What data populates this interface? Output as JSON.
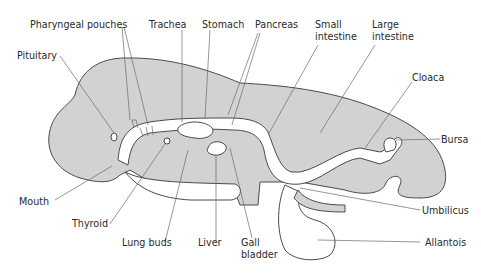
{
  "diagram": {
    "title": "",
    "colors": {
      "tissue": "#d2d2d2",
      "outline": "#4a4a4a",
      "lumen": "#ffffff",
      "text": "#2a2a2a"
    },
    "labels": {
      "pharyngeal_pouches": "Pharyngeal pouches",
      "trachea": "Trachea",
      "stomach": "Stomach",
      "pancreas": "Pancreas",
      "small_intestine_1": "Small",
      "small_intestine_2": "intestine",
      "large_intestine_1": "Large",
      "large_intestine_2": "intestine",
      "pituitary": "Pituitary",
      "cloaca": "Cloaca",
      "bursa": "Bursa",
      "mouth": "Mouth",
      "thyroid": "Thyroid",
      "lung_buds": "Lung buds",
      "liver": "Liver",
      "gall_bladder_1": "Gall",
      "gall_bladder_2": "bladder",
      "umbilicus": "Umbilicus",
      "allantois": "Allantois"
    }
  }
}
